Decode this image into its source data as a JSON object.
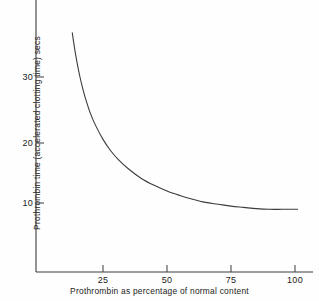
{
  "chart_data": {
    "type": "line",
    "title": "",
    "subtitle": "",
    "xlabel": "Prothrombin as percentage of normal content",
    "ylabel": "Prothrombin time (accelerated clotting time) secs",
    "xlim": [
      0,
      110
    ],
    "ylim": [
      0,
      41
    ],
    "grid": false,
    "legend": null,
    "xticks": [
      25,
      50,
      75,
      100
    ],
    "xtick_labels": [
      "25",
      "50",
      "75",
      "100"
    ],
    "yticks": [
      10,
      20,
      30
    ],
    "ytick_labels": [
      "10",
      "20",
      "30"
    ],
    "series": [
      {
        "name": "Prothrombin time vs prothrombin concentration",
        "color": "#3c3c3c",
        "x": [
          13,
          14,
          15,
          16,
          17,
          18,
          20,
          22,
          25,
          28,
          31,
          35,
          40,
          45,
          50,
          55,
          60,
          65,
          70,
          75,
          80,
          85,
          90,
          95,
          101
        ],
        "y": [
          37.0,
          34.3,
          32.0,
          30.0,
          28.3,
          26.8,
          24.3,
          22.4,
          20.1,
          18.3,
          16.9,
          15.4,
          13.9,
          12.8,
          11.9,
          11.2,
          10.6,
          10.1,
          9.8,
          9.5,
          9.3,
          9.1,
          9.0,
          9.0,
          9.0
        ]
      }
    ],
    "annotations": []
  },
  "axes": {
    "y_axis_label": "Prothrombin time (accelerated clotting time) secs",
    "x_axis_label": "Prothrombin as percentage of normal content"
  },
  "colors": {
    "curve": "#3c3c3c",
    "axis": "#3a3a3a",
    "text": "#222222",
    "background": "#fefefe"
  }
}
